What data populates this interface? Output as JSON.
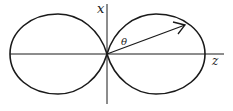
{
  "diagram": {
    "type": "polar-radiation-pattern",
    "labels": {
      "vertical_axis": "x",
      "horizontal_axis": "z",
      "angle": "θ"
    },
    "colors": {
      "stroke": "#1a1a1a",
      "background": "#ffffff"
    }
  }
}
